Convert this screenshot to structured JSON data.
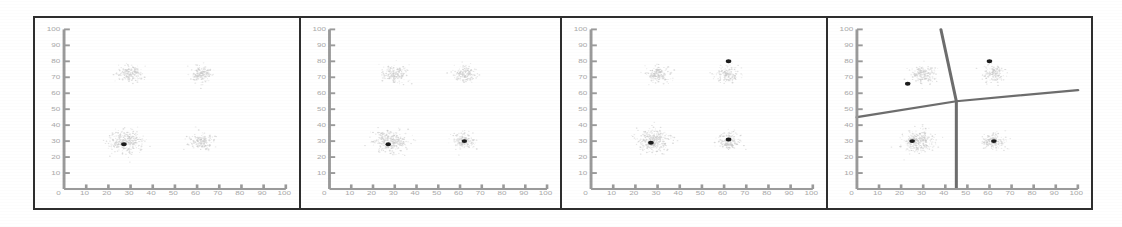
{
  "figure": {
    "panel_count": 4,
    "background_color": "#ffffff",
    "frame_color": "#2e2e2e",
    "centroid_color": "#1c1c1c",
    "point_cloud_color": "#c9c9c9",
    "axis_color": "#9a9a9a",
    "voronoi_edge_color": "#6d6d6d"
  },
  "chart_data": {
    "type": "scatter",
    "subtitle": "Four Gaussian clusters with progressively added centroids and a final Voronoi partition",
    "xlabel": "",
    "ylabel": "",
    "xlim": [
      0,
      100
    ],
    "ylim": [
      0,
      100
    ],
    "grid": false,
    "legend": "none",
    "x_ticks": [
      0,
      10,
      20,
      30,
      40,
      50,
      60,
      70,
      80,
      90,
      100
    ],
    "y_ticks": [
      0,
      10,
      20,
      30,
      40,
      50,
      60,
      70,
      80,
      90,
      100
    ],
    "x_tick_labels": [
      "0",
      "10",
      "20",
      "30",
      "40",
      "50",
      "60",
      "70",
      "80",
      "90",
      "100"
    ],
    "y_tick_labels": [
      "0",
      "10",
      "20",
      "30",
      "40",
      "50",
      "60",
      "70",
      "80",
      "90",
      "100"
    ],
    "clusters": [
      {
        "name": "bottom-left",
        "center_x": 28,
        "center_y": 30,
        "spread": 8.5,
        "n_points": 300,
        "density": "high"
      },
      {
        "name": "bottom-right",
        "center_x": 62,
        "center_y": 30,
        "spread": 6.0,
        "n_points": 170,
        "density": "medium"
      },
      {
        "name": "top-left",
        "center_x": 30,
        "center_y": 72,
        "spread": 6.5,
        "n_points": 180,
        "density": "medium"
      },
      {
        "name": "top-right",
        "center_x": 62,
        "center_y": 72,
        "spread": 6.0,
        "n_points": 160,
        "density": "medium"
      }
    ],
    "panels": [
      {
        "index": 1,
        "label": "Panel 1",
        "caption": "One centroid placed",
        "centroid_count": 1,
        "centroids": [
          {
            "x": 27,
            "y": 28
          }
        ],
        "voronoi": false
      },
      {
        "index": 2,
        "label": "Panel 2",
        "caption": "Two centroids placed",
        "centroid_count": 2,
        "centroids": [
          {
            "x": 27,
            "y": 28
          },
          {
            "x": 62,
            "y": 30
          }
        ],
        "voronoi": false
      },
      {
        "index": 3,
        "label": "Panel 3",
        "caption": "Three centroids placed",
        "centroid_count": 3,
        "centroids": [
          {
            "x": 27,
            "y": 29
          },
          {
            "x": 62,
            "y": 31
          },
          {
            "x": 62,
            "y": 80
          }
        ],
        "voronoi": false
      },
      {
        "index": 4,
        "label": "Panel 4",
        "caption": "Four centroids with Voronoi partition",
        "centroid_count": 4,
        "centroids": [
          {
            "x": 25,
            "y": 30
          },
          {
            "x": 62,
            "y": 30
          },
          {
            "x": 23,
            "y": 66
          },
          {
            "x": 60,
            "y": 80
          }
        ],
        "voronoi": true,
        "voronoi_junction": {
          "x": 45,
          "y": 55
        },
        "voronoi_edges": [
          {
            "from": {
              "x": 45,
              "y": 55
            },
            "to": {
              "x": 38,
              "y": 100
            }
          },
          {
            "from": {
              "x": 45,
              "y": 55
            },
            "to": {
              "x": 100,
              "y": 62
            }
          },
          {
            "from": {
              "x": 45,
              "y": 55
            },
            "to": {
              "x": 0,
              "y": 45
            }
          },
          {
            "from": {
              "x": 45,
              "y": 55
            },
            "to": {
              "x": 45,
              "y": 0
            }
          }
        ]
      }
    ]
  }
}
